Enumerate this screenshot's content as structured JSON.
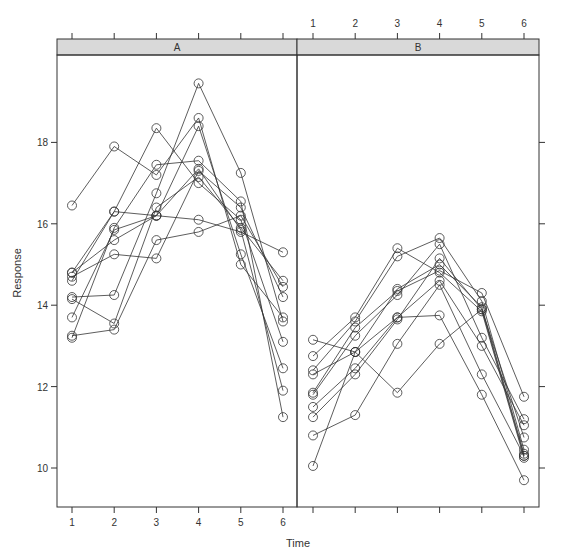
{
  "chart_data": {
    "type": "line",
    "title": "",
    "xlabel": "Time",
    "ylabel": "Response",
    "x": [
      1,
      2,
      3,
      4,
      5,
      6
    ],
    "ylim": [
      9.1,
      20.0
    ],
    "yticks": [
      10,
      12,
      14,
      16,
      18
    ],
    "xticks": [
      1,
      2,
      3,
      4,
      5,
      6
    ],
    "grid": false,
    "marker": "open-circle",
    "panels": [
      {
        "name": "A",
        "series": [
          {
            "name": "A1",
            "values": [
              16.45,
              17.9,
              17.2,
              18.6,
              15.0,
              13.7
            ]
          },
          {
            "name": "A2",
            "values": [
              14.8,
              16.3,
              16.2,
              18.4,
              15.25,
              12.45
            ]
          },
          {
            "name": "A3",
            "values": [
              14.7,
              15.25,
              15.15,
              17.3,
              16.4,
              14.2
            ]
          },
          {
            "name": "A4",
            "values": [
              14.6,
              16.3,
              18.35,
              17.0,
              16.1,
              13.1
            ]
          },
          {
            "name": "A5",
            "values": [
              14.2,
              14.25,
              16.75,
              19.45,
              17.25,
              13.6
            ]
          },
          {
            "name": "A6",
            "values": [
              14.15,
              13.55,
              16.4,
              17.15,
              15.9,
              14.6
            ]
          },
          {
            "name": "A7",
            "values": [
              13.7,
              15.85,
              16.2,
              16.1,
              15.8,
              15.3
            ]
          },
          {
            "name": "A8",
            "values": [
              13.25,
              13.4,
              15.6,
              15.8,
              16.2,
              14.45
            ]
          },
          {
            "name": "A9",
            "values": [
              13.2,
              15.9,
              17.45,
              17.55,
              16.55,
              11.25
            ]
          },
          {
            "name": "A10",
            "values": [
              14.8,
              15.6,
              16.2,
              17.35,
              15.85,
              11.9
            ]
          }
        ]
      },
      {
        "name": "B",
        "series": [
          {
            "name": "B1",
            "values": [
              13.15,
              12.85,
              11.85,
              13.05,
              13.9,
              10.3
            ]
          },
          {
            "name": "B2",
            "values": [
              12.75,
              13.7,
              15.4,
              14.8,
              13.85,
              10.25
            ]
          },
          {
            "name": "B3",
            "values": [
              12.4,
              13.6,
              15.2,
              15.65,
              14.1,
              10.45
            ]
          },
          {
            "name": "B4",
            "values": [
              12.3,
              12.85,
              14.4,
              15.0,
              13.95,
              10.35
            ]
          },
          {
            "name": "B5",
            "values": [
              11.85,
              13.45,
              14.35,
              14.85,
              14.3,
              11.75
            ]
          },
          {
            "name": "B6",
            "values": [
              11.8,
              13.25,
              14.25,
              15.5,
              13.2,
              11.2
            ]
          },
          {
            "name": "B7",
            "values": [
              11.5,
              12.45,
              13.7,
              14.6,
              13.0,
              11.05
            ]
          },
          {
            "name": "B8",
            "values": [
              11.25,
              12.3,
              13.65,
              15.15,
              13.9,
              10.75
            ]
          },
          {
            "name": "B9",
            "values": [
              10.8,
              11.3,
              13.05,
              14.5,
              12.3,
              10.3
            ]
          },
          {
            "name": "B10",
            "values": [
              10.05,
              12.85,
              13.7,
              13.75,
              11.8,
              9.7
            ]
          }
        ]
      }
    ]
  }
}
